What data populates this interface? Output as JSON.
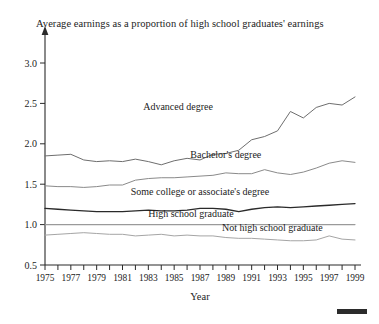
{
  "chart_data": {
    "type": "line",
    "title": "Average earnings as a proportion of high school graduates' earnings",
    "xlabel": "Year",
    "ylabel": "",
    "xlim": [
      1975,
      1999
    ],
    "ylim": [
      0.5,
      3.0
    ],
    "ytick_labels": [
      "0.5",
      "1.0",
      "1.5",
      "2.0",
      "2.5",
      "3.0"
    ],
    "ytick_values": [
      0.5,
      1.0,
      1.5,
      2.0,
      2.5,
      3.0
    ],
    "xtick_values": [
      1975,
      1976,
      1977,
      1978,
      1979,
      1980,
      1981,
      1982,
      1983,
      1984,
      1985,
      1986,
      1987,
      1988,
      1989,
      1990,
      1991,
      1992,
      1993,
      1994,
      1995,
      1996,
      1997,
      1998,
      1999
    ],
    "xtick_labels": [
      "1975",
      "",
      "1977",
      "",
      "1979",
      "",
      "1981",
      "",
      "1983",
      "",
      "1985",
      "",
      "1987",
      "",
      "1989",
      "",
      "1991",
      "",
      "1993",
      "",
      "1995",
      "",
      "1997",
      "",
      "1999"
    ],
    "grid": false,
    "legend_position": "inline-annotations",
    "x": [
      1975,
      1976,
      1977,
      1978,
      1979,
      1980,
      1981,
      1982,
      1983,
      1984,
      1985,
      1986,
      1987,
      1988,
      1989,
      1990,
      1991,
      1992,
      1993,
      1994,
      1995,
      1996,
      1997,
      1998,
      1999
    ],
    "series": [
      {
        "name": "Advanced degree",
        "color": "#6e6e6e",
        "width": 1.0,
        "label_x": 1985.3,
        "label_y": 2.42,
        "values": [
          1.85,
          1.86,
          1.87,
          1.8,
          1.78,
          1.79,
          1.78,
          1.81,
          1.78,
          1.74,
          1.79,
          1.82,
          1.8,
          1.87,
          1.88,
          1.92,
          2.05,
          2.09,
          2.16,
          2.4,
          2.32,
          2.45,
          2.5,
          2.48,
          2.58
        ]
      },
      {
        "name": "Bachelor's degree",
        "color": "#8a8a8a",
        "width": 1.0,
        "label_x": 1989.0,
        "label_y": 1.83,
        "values": [
          1.48,
          1.47,
          1.47,
          1.46,
          1.47,
          1.49,
          1.49,
          1.55,
          1.57,
          1.58,
          1.58,
          1.59,
          1.6,
          1.61,
          1.64,
          1.63,
          1.63,
          1.68,
          1.64,
          1.62,
          1.65,
          1.7,
          1.76,
          1.79,
          1.77
        ]
      },
      {
        "name": "Some college or associate's degree",
        "color": "#2a2a2a",
        "width": 1.35,
        "label_x": 1987.0,
        "label_y": 1.37,
        "values": [
          1.2,
          1.19,
          1.18,
          1.17,
          1.16,
          1.16,
          1.16,
          1.17,
          1.18,
          1.17,
          1.17,
          1.18,
          1.2,
          1.2,
          1.19,
          1.16,
          1.19,
          1.21,
          1.22,
          1.21,
          1.22,
          1.23,
          1.24,
          1.25,
          1.26
        ]
      },
      {
        "name": "High school graduate",
        "color": "#9a9a9a",
        "width": 1.1,
        "label_x": 1986.3,
        "label_y": 1.1,
        "values": [
          1.0,
          1.0,
          1.0,
          1.0,
          1.0,
          1.0,
          1.0,
          1.0,
          1.0,
          1.0,
          1.0,
          1.0,
          1.0,
          1.0,
          1.0,
          1.0,
          1.0,
          1.0,
          1.0,
          1.0,
          1.0,
          1.0,
          1.0,
          1.0,
          1.0
        ]
      },
      {
        "name": "Not high school graduate",
        "color": "#a5a5a5",
        "width": 1.0,
        "label_x": 1992.6,
        "label_y": 0.92,
        "values": [
          0.87,
          0.88,
          0.89,
          0.9,
          0.89,
          0.88,
          0.88,
          0.86,
          0.87,
          0.88,
          0.86,
          0.87,
          0.86,
          0.86,
          0.84,
          0.83,
          0.83,
          0.82,
          0.81,
          0.8,
          0.8,
          0.81,
          0.86,
          0.82,
          0.81
        ]
      }
    ]
  },
  "figure": {
    "corner_mark": "scale-bar"
  }
}
